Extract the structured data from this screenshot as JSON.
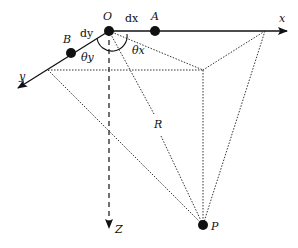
{
  "diagram": {
    "points": {
      "origin": "O",
      "point_a": "A",
      "point_b": "B",
      "point_p": "P"
    },
    "axes": {
      "x": "x",
      "y": "y",
      "z": "Z"
    },
    "labels": {
      "dx": "dx",
      "dy": "dy",
      "theta_x": "θx",
      "theta_y": "θy",
      "distance": "R"
    },
    "colors": {
      "ink": "#111111",
      "background": "#ffffff"
    }
  }
}
